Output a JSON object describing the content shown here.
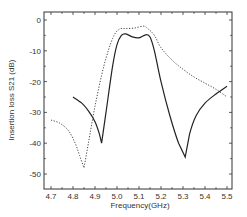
{
  "chart_data": {
    "type": "line",
    "title": "",
    "xlabel": "Frequency(GHz)",
    "ylabel": "Insertion loss S21 (dB)",
    "xlim": [
      4.67,
      5.54
    ],
    "ylim": [
      -53,
      2.5
    ],
    "xticks": [
      4.7,
      4.8,
      4.9,
      5.0,
      5.1,
      5.2,
      5.3,
      5.4,
      5.5
    ],
    "xtick_labels": [
      "4.7",
      "4.8",
      "4.9",
      "5.0",
      "5.1",
      "5.2",
      "5.3",
      "5.4",
      "5.5"
    ],
    "yticks": [
      0,
      -10,
      -20,
      -30,
      -40,
      -50
    ],
    "ytick_labels": [
      "0",
      "-10",
      "-20",
      "-30",
      "-40",
      "-50"
    ],
    "grid": false,
    "legend": null,
    "series": [
      {
        "name": "solid",
        "style": "solid",
        "color": "#222222",
        "x": [
          4.8,
          4.84,
          4.87,
          4.9,
          4.92,
          4.93,
          4.95,
          4.98,
          5.0,
          5.02,
          5.04,
          5.07,
          5.1,
          5.13,
          5.15,
          5.17,
          5.2,
          5.24,
          5.28,
          5.31,
          5.33,
          5.36,
          5.4,
          5.45,
          5.5
        ],
        "y": [
          -25,
          -27,
          -29.5,
          -33,
          -37,
          -40,
          -30,
          -15,
          -8,
          -5,
          -4.5,
          -5.5,
          -5.8,
          -4.8,
          -5.5,
          -10,
          -20,
          -31,
          -40,
          -44.5,
          -37,
          -31,
          -27,
          -24,
          -21.5
        ]
      },
      {
        "name": "dotted",
        "style": "dotted",
        "color": "#444444",
        "x": [
          4.7,
          4.74,
          4.78,
          4.81,
          4.83,
          4.85,
          4.87,
          4.9,
          4.94,
          4.98,
          5.01,
          5.04,
          5.08,
          5.12,
          5.14,
          5.17,
          5.2,
          5.25,
          5.3,
          5.35,
          5.4,
          5.45,
          5.5
        ],
        "y": [
          -32.5,
          -33.5,
          -36,
          -40,
          -44,
          -48,
          -40,
          -28,
          -15,
          -6,
          -3,
          -2.8,
          -2.6,
          -2,
          -2.8,
          -5,
          -9,
          -13,
          -16,
          -18.5,
          -20.5,
          -22.5,
          -25
        ]
      }
    ]
  },
  "labels": {
    "xlabel": "Frequency(GHz)",
    "ylabel": "Insertion loss S21 (dB)"
  }
}
